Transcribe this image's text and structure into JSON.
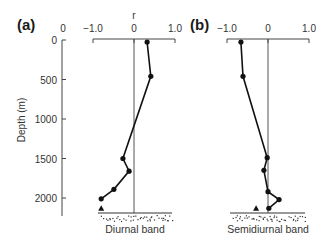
{
  "chart_data": [
    {
      "type": "line",
      "panel_label": "(a)",
      "caption": "Diurnal band",
      "xlabel": "r",
      "ylabel": "Depth (m)",
      "xlim": [
        -1.0,
        1.0
      ],
      "ylim": [
        0,
        2200
      ],
      "x_ticks": [
        "−1.0",
        "0",
        "1.0"
      ],
      "x_tick_values": [
        -1.0,
        0,
        1.0
      ],
      "y_ticks": [
        "0",
        "500",
        "1000",
        "1500",
        "2000"
      ],
      "y_tick_values": [
        0,
        500,
        1000,
        1500,
        2000
      ],
      "depth_axis_top_label": "0",
      "series": [
        {
          "name": "correlation",
          "marker": "circle",
          "points": [
            {
              "r": 0.32,
              "depth": 25
            },
            {
              "r": 0.41,
              "depth": 460
            },
            {
              "r": -0.27,
              "depth": 1500
            },
            {
              "r": -0.12,
              "depth": 1660
            },
            {
              "r": -0.49,
              "depth": 1890
            },
            {
              "r": -0.8,
              "depth": 2010
            }
          ]
        },
        {
          "name": "near-bottom",
          "marker": "triangle",
          "points": [
            {
              "r": -0.8,
              "depth": 2130
            }
          ]
        }
      ],
      "zero_line": true,
      "seabed": true
    },
    {
      "type": "line",
      "panel_label": "(b)",
      "caption": "Semidiurnal band",
      "xlabel": "",
      "ylabel": "",
      "xlim": [
        -1.0,
        1.0
      ],
      "ylim": [
        0,
        2200
      ],
      "x_ticks": [
        "−1.0",
        "0",
        "1.0"
      ],
      "x_tick_values": [
        -1.0,
        0,
        1.0
      ],
      "series": [
        {
          "name": "correlation",
          "marker": "circle",
          "points": [
            {
              "r": -0.66,
              "depth": 25
            },
            {
              "r": -0.61,
              "depth": 460
            },
            {
              "r": -0.02,
              "depth": 1490
            },
            {
              "r": -0.1,
              "depth": 1650
            },
            {
              "r": 0.0,
              "depth": 1920
            },
            {
              "r": 0.27,
              "depth": 2020
            },
            {
              "r": 0.02,
              "depth": 2130
            }
          ]
        },
        {
          "name": "near-bottom",
          "marker": "triangle",
          "points": [
            {
              "r": -0.29,
              "depth": 2130
            }
          ]
        }
      ],
      "zero_line": true,
      "seabed": true
    }
  ]
}
